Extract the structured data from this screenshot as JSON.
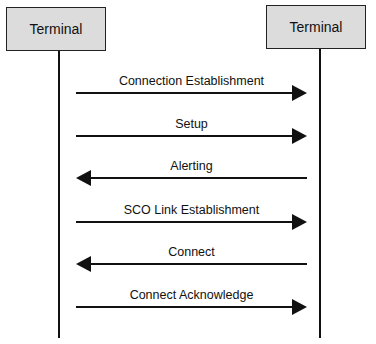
{
  "participants": [
    {
      "label": "Terminal"
    },
    {
      "label": "Terminal"
    }
  ],
  "messages": [
    {
      "label": "Connection Establishment",
      "direction": "right"
    },
    {
      "label": "Setup",
      "direction": "right"
    },
    {
      "label": "Alerting",
      "direction": "left"
    },
    {
      "label": "SCO Link Establishment",
      "direction": "right"
    },
    {
      "label": "Connect",
      "direction": "left"
    },
    {
      "label": "Connect Acknowledge",
      "direction": "right"
    }
  ],
  "colors": {
    "box_fill": "#dcdcdc",
    "line": "#111111"
  }
}
